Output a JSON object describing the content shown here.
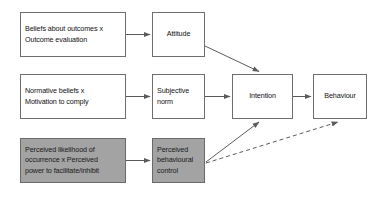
{
  "diagram": {
    "canvas": {
      "width": 387,
      "height": 201
    },
    "colors": {
      "background": "#ffffff",
      "box_border": "#6e6e6e",
      "box_fill": "#ffffff",
      "shaded_fill": "#a3a3a3",
      "arrow": "#5b5b5b",
      "text": "#111111"
    },
    "nodes": [
      {
        "id": "beliefs-outcomes",
        "label": "Beliefs about outcomes x\nOutcome evaluation",
        "shaded": false,
        "x": 20,
        "y": 12,
        "w": 106,
        "h": 45
      },
      {
        "id": "attitude",
        "label": "Attitude",
        "shaded": false,
        "x": 152,
        "y": 12,
        "w": 53,
        "h": 45
      },
      {
        "id": "normative-beliefs",
        "label": "Normative beliefs x\nMotivation to comply",
        "shaded": false,
        "x": 20,
        "y": 74,
        "w": 106,
        "h": 45
      },
      {
        "id": "subjective-norm",
        "label": "Subjective\nnorm",
        "shaded": false,
        "x": 152,
        "y": 74,
        "w": 53,
        "h": 45
      },
      {
        "id": "intention",
        "label": "Intention",
        "shaded": false,
        "x": 232,
        "y": 74,
        "w": 61,
        "h": 45
      },
      {
        "id": "behaviour",
        "label": "Behaviour",
        "shaded": false,
        "x": 313,
        "y": 74,
        "w": 54,
        "h": 45
      },
      {
        "id": "perceived-likelihood",
        "label": "Perceived likelihood of\noccurrence x Perceived\npower to facilitate/inhibit",
        "shaded": true,
        "x": 20,
        "y": 138,
        "w": 106,
        "h": 45
      },
      {
        "id": "perceived-control",
        "label": "Perceived\nbehavioural\ncontrol",
        "shaded": true,
        "x": 152,
        "y": 138,
        "w": 53,
        "h": 45
      }
    ],
    "edges": [
      {
        "id": "beliefs-to-attitude",
        "from": "beliefs-outcomes",
        "to": "attitude",
        "style": "solid"
      },
      {
        "id": "attitude-to-intention",
        "from": "attitude",
        "to": "intention",
        "style": "solid"
      },
      {
        "id": "normative-to-subjective",
        "from": "normative-beliefs",
        "to": "subjective-norm",
        "style": "solid"
      },
      {
        "id": "subjective-to-intention",
        "from": "subjective-norm",
        "to": "intention",
        "style": "solid"
      },
      {
        "id": "intention-to-behaviour",
        "from": "intention",
        "to": "behaviour",
        "style": "solid"
      },
      {
        "id": "likelihood-to-control",
        "from": "perceived-likelihood",
        "to": "perceived-control",
        "style": "solid"
      },
      {
        "id": "control-to-intention",
        "from": "perceived-control",
        "to": "intention",
        "style": "solid"
      },
      {
        "id": "control-to-behaviour",
        "from": "perceived-control",
        "to": "behaviour",
        "style": "dashed"
      }
    ]
  }
}
